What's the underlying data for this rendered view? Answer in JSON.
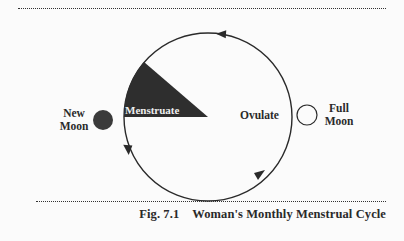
{
  "diagram": {
    "phases": {
      "menstruate": "Menstruate",
      "ovulate": "Ovulate"
    },
    "moons": {
      "new_moon_line1": "New",
      "new_moon_line2": "Moon",
      "full_moon_line1": "Full",
      "full_moon_line2": "Moon"
    },
    "colors": {
      "ink": "#2a2a2a",
      "background": "#fbfbfb"
    }
  },
  "caption": {
    "figure_number": "Fig. 7.1",
    "title": "Woman's Monthly Menstrual Cycle"
  }
}
